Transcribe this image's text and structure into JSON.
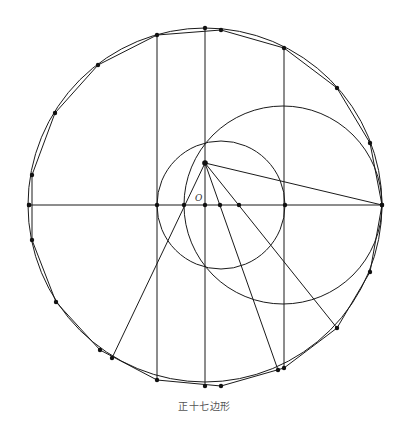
{
  "caption": "正十七边形",
  "center_label": "O",
  "colors": {
    "line": "#1a1a1a",
    "dot": "#111111",
    "caption": "#555555",
    "background": "#ffffff"
  },
  "geometry": {
    "outer_circle": {
      "cx": 205,
      "cy": 205,
      "r": 177
    },
    "small_circle": {
      "cx": 221,
      "cy": 205,
      "r": 64
    },
    "large_circle": {
      "cx": 283,
      "cy": 205,
      "r": 99
    },
    "center": {
      "x": 205,
      "y": 205
    },
    "construction_point": {
      "x": 205,
      "y": 163
    },
    "polygon_vertices": [
      [
        382,
        205
      ],
      [
        370,
        143
      ],
      [
        337,
        88
      ],
      [
        284,
        48
      ],
      [
        221,
        30
      ],
      [
        157,
        35
      ],
      [
        98,
        65
      ],
      [
        55,
        113
      ],
      [
        32,
        175
      ],
      [
        32,
        240
      ],
      [
        56,
        302
      ],
      [
        100,
        350
      ],
      [
        157,
        380
      ],
      [
        221,
        386
      ],
      [
        284,
        368
      ],
      [
        337,
        328
      ],
      [
        370,
        272
      ]
    ],
    "extra_points_on_circle": [
      [
        29,
        205
      ],
      [
        205,
        28
      ],
      [
        205,
        386
      ],
      [
        112,
        358
      ],
      [
        278,
        370
      ]
    ],
    "axis_points": [
      [
        29,
        205
      ],
      [
        157,
        205
      ],
      [
        184,
        205
      ],
      [
        205,
        205
      ],
      [
        220,
        205
      ],
      [
        239,
        205
      ],
      [
        285,
        205
      ],
      [
        382,
        205
      ]
    ],
    "horizontal_axis": [
      [
        29,
        205
      ],
      [
        382,
        205
      ]
    ],
    "vertical_lines": [
      [
        [
          157,
          35
        ],
        [
          157,
          380
        ]
      ],
      [
        [
          205,
          28
        ],
        [
          205,
          386
        ]
      ],
      [
        [
          284,
          48
        ],
        [
          284,
          368
        ]
      ]
    ],
    "rays_from_construction_point": [
      [
        [
          205,
          163
        ],
        [
          382,
          205
        ]
      ],
      [
        [
          205,
          163
        ],
        [
          112,
          358
        ]
      ],
      [
        [
          205,
          163
        ],
        [
          278,
          370
        ]
      ],
      [
        [
          205,
          163
        ],
        [
          337,
          328
        ]
      ]
    ]
  }
}
